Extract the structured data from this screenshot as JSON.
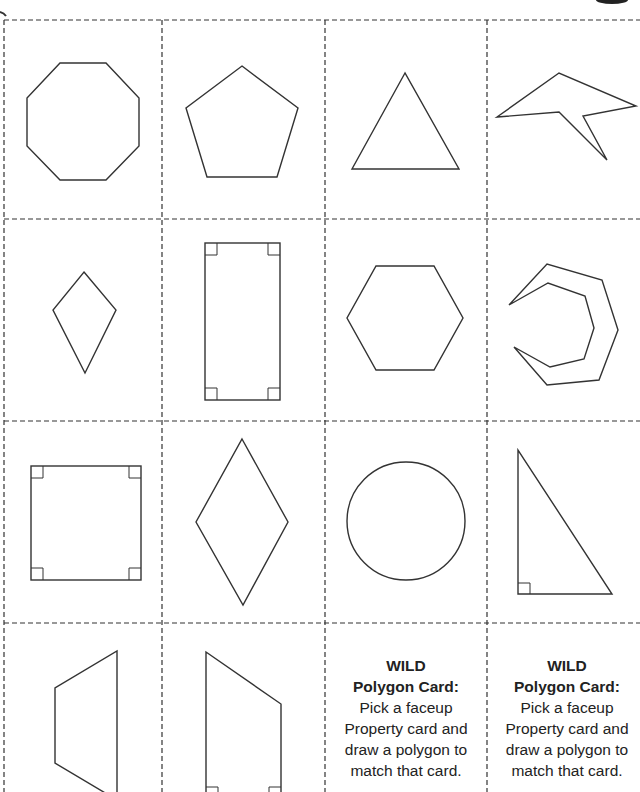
{
  "sheet": {
    "line_color": "#333333",
    "grid": {
      "columns_x": [
        4,
        162,
        325,
        488,
        640
      ],
      "rows_y": [
        20,
        219,
        421,
        623,
        800
      ]
    }
  },
  "cards": [
    {
      "row": 0,
      "col": 0,
      "shape": "octagon"
    },
    {
      "row": 0,
      "col": 1,
      "shape": "pentagon"
    },
    {
      "row": 0,
      "col": 2,
      "shape": "triangle"
    },
    {
      "row": 0,
      "col": 3,
      "shape": "concave-polygon"
    },
    {
      "row": 1,
      "col": 0,
      "shape": "kite"
    },
    {
      "row": 1,
      "col": 1,
      "shape": "rectangle"
    },
    {
      "row": 1,
      "col": 2,
      "shape": "hexagon"
    },
    {
      "row": 1,
      "col": 3,
      "shape": "concave-crescent-polygon"
    },
    {
      "row": 2,
      "col": 0,
      "shape": "square"
    },
    {
      "row": 2,
      "col": 1,
      "shape": "rhombus"
    },
    {
      "row": 2,
      "col": 2,
      "shape": "circle"
    },
    {
      "row": 2,
      "col": 3,
      "shape": "right-triangle"
    },
    {
      "row": 3,
      "col": 0,
      "shape": "trapezoid"
    },
    {
      "row": 3,
      "col": 1,
      "shape": "right-trapezoid"
    },
    {
      "row": 3,
      "col": 2,
      "shape": "wild-card"
    },
    {
      "row": 3,
      "col": 3,
      "shape": "wild-card"
    }
  ],
  "wild_cards": [
    {
      "title_1": "WILD",
      "title_2": "Polygon Card:",
      "body": [
        "Pick a faceup",
        "Property card and",
        "draw a polygon to",
        "match that card."
      ]
    },
    {
      "title_1": "WILD",
      "title_2": "Polygon Card:",
      "body": [
        "Pick a faceup",
        "Property card and",
        "draw a polygon to",
        "match that card."
      ]
    }
  ]
}
